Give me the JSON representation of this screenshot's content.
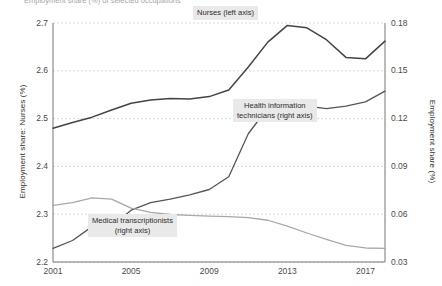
{
  "figure": {
    "clipped_top_title": "Employment share (%) of selected occupations"
  },
  "axes": {
    "left_title": "Employment share: Nurses (%)",
    "right_title": "Employment share (%)",
    "left_ticks": [
      "2.7",
      "2.6",
      "2.5",
      "2.4",
      "2.3",
      "2.2"
    ],
    "right_ticks": [
      "0.18",
      "0.15",
      "0.12",
      "0.09",
      "0.06",
      "0.03"
    ],
    "x_ticks": [
      "2001",
      "2005",
      "2009",
      "2013",
      "2017"
    ]
  },
  "labels": {
    "nurses": "Nurses (left axis)",
    "hit_line1": "Health information",
    "hit_line2": "technicians (right axis)",
    "mt_line1": "Medical transcriptionists",
    "mt_line2": "(right axis)"
  },
  "colors": {
    "nurses": "#444444",
    "hit": "#555555",
    "mt": "#a8a8a8",
    "grid": "#d9d9d9",
    "axis": "#777777",
    "label_bg": "#e9e9e9"
  },
  "chart_data": {
    "type": "line",
    "title": "Employment share (%) of selected occupations",
    "xlabel": "",
    "ylabel": "Employment share: Nurses (%)",
    "y2label": "Employment share (%)",
    "grid": true,
    "legend": "inline-annotations",
    "x": [
      2001,
      2002,
      2003,
      2004,
      2005,
      2006,
      2007,
      2008,
      2009,
      2010,
      2011,
      2012,
      2013,
      2014,
      2015,
      2016,
      2017,
      2018
    ],
    "xlim": [
      2001,
      2018
    ],
    "ylim": [
      2.2,
      2.7
    ],
    "y2lim": [
      0.03,
      0.18
    ],
    "yticks": [
      2.2,
      2.3,
      2.4,
      2.5,
      2.6,
      2.7
    ],
    "y2ticks": [
      0.03,
      0.06,
      0.09,
      0.12,
      0.15,
      0.18
    ],
    "series": [
      {
        "name": "Nurses (left axis)",
        "axis": "left",
        "color": "#444444",
        "values": [
          2.48,
          2.492,
          2.503,
          2.518,
          2.532,
          2.539,
          2.542,
          2.541,
          2.546,
          2.56,
          2.608,
          2.66,
          2.695,
          2.69,
          2.665,
          2.628,
          2.625,
          2.662
        ]
      },
      {
        "name": "Health information technicians (right axis)",
        "axis": "right",
        "color": "#555555",
        "values": [
          0.0385,
          0.0435,
          0.0522,
          0.0525,
          0.0625,
          0.0672,
          0.0695,
          0.0722,
          0.0755,
          0.0835,
          0.1105,
          0.1268,
          0.1295,
          0.1278,
          0.1262,
          0.1278,
          0.1305,
          0.1372
        ]
      },
      {
        "name": "Medical transcriptionists (right axis)",
        "axis": "right",
        "color": "#a8a8a8",
        "values": [
          0.0655,
          0.0672,
          0.0702,
          0.0695,
          0.0638,
          0.0612,
          0.0598,
          0.0592,
          0.0588,
          0.0585,
          0.0578,
          0.0562,
          0.0525,
          0.0482,
          0.0442,
          0.0405,
          0.0388,
          0.0385
        ]
      }
    ]
  }
}
